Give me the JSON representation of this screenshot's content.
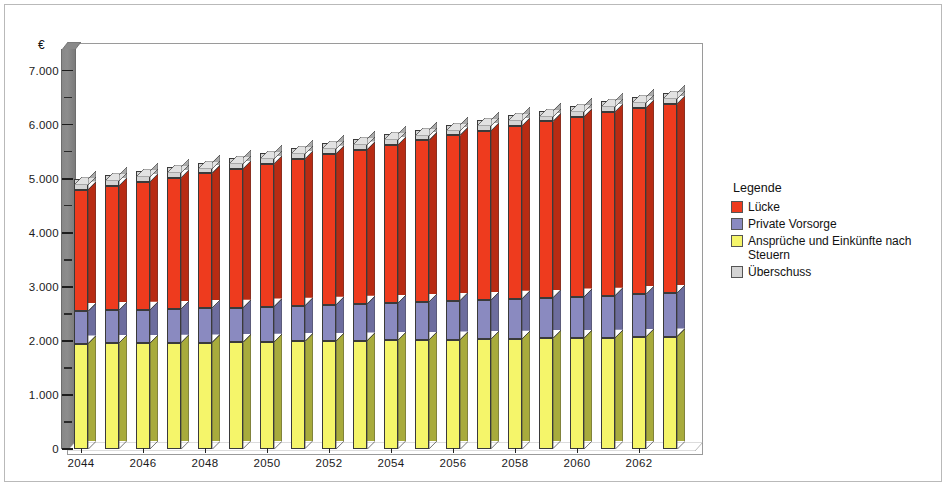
{
  "axis": {
    "unit_symbol": "€",
    "y_ticks": [
      "0",
      "1.000",
      "2.000",
      "3.000",
      "4.000",
      "5.000",
      "6.000",
      "7.000"
    ],
    "x_ticks": [
      "2044",
      "2046",
      "2048",
      "2050",
      "2052",
      "2054",
      "2056",
      "2058",
      "2060",
      "2062"
    ]
  },
  "legend": {
    "title": "Legende",
    "items": [
      {
        "label": "Lücke",
        "color": "#ee3b1e"
      },
      {
        "label": "Private Vorsorge",
        "color": "#8a8ac0"
      },
      {
        "label": "Ansprüche und Einkünfte nach Steuern",
        "color": "#f5f56a"
      },
      {
        "label": "Überschuss",
        "color": "#d4d4d4"
      }
    ]
  },
  "chart_data": {
    "type": "bar",
    "stacked": true,
    "title": "",
    "xlabel": "",
    "ylabel": "€",
    "ylim": [
      0,
      7400
    ],
    "grid": false,
    "legend_position": "right",
    "categories": [
      "2044",
      "2045",
      "2046",
      "2047",
      "2048",
      "2049",
      "2050",
      "2051",
      "2052",
      "2053",
      "2054",
      "2055",
      "2056",
      "2057",
      "2058",
      "2059",
      "2060",
      "2061",
      "2062",
      "2063"
    ],
    "series": [
      {
        "name": "Ansprüche und Einkünfte nach Steuern",
        "color": "#f5f56a",
        "side_color": "#a8ab3c",
        "values": [
          1950,
          1955,
          1960,
          1965,
          1970,
          1975,
          1985,
          1990,
          2000,
          2005,
          2010,
          2015,
          2025,
          2030,
          2040,
          2045,
          2055,
          2060,
          2070,
          2080
        ]
      },
      {
        "name": "Private Vorsorge",
        "color": "#8a8ac0",
        "side_color": "#6d6d9e",
        "values": [
          600,
          610,
          615,
          620,
          630,
          640,
          650,
          660,
          670,
          680,
          690,
          700,
          715,
          725,
          740,
          750,
          765,
          775,
          790,
          800
        ]
      },
      {
        "name": "Lücke",
        "color": "#ee3b1e",
        "side_color": "#b82b13",
        "values": [
          2250,
          2300,
          2365,
          2425,
          2500,
          2565,
          2635,
          2710,
          2790,
          2855,
          2925,
          2995,
          3060,
          3130,
          3195,
          3265,
          3330,
          3395,
          3450,
          3500
        ]
      },
      {
        "name": "Überschuss",
        "color": "#d4d4d4",
        "side_color": "#a9a9a9",
        "values": [
          200,
          200,
          200,
          200,
          200,
          200,
          200,
          200,
          200,
          200,
          200,
          200,
          200,
          200,
          200,
          200,
          200,
          200,
          200,
          200
        ]
      }
    ]
  }
}
